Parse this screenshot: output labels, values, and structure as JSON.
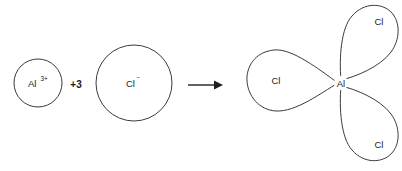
{
  "diagram": {
    "type": "chemical-reaction",
    "background_color": "#ffffff",
    "stroke_color": "#3b3b3b",
    "text_color": "#1a1a1a",
    "reactants": [
      {
        "id": "aluminium-ion",
        "shape": "circle",
        "label_base": "Al",
        "label_superscript": "3+",
        "cx": 38,
        "cy": 83,
        "r": 24
      },
      {
        "id": "chloride-ion",
        "shape": "circle",
        "label_base": "Cl",
        "label_superscript": "−",
        "cx": 134,
        "cy": 83,
        "r": 38
      }
    ],
    "coefficient": {
      "id": "chloride-coefficient",
      "text": "+3",
      "x": 76,
      "y": 85
    },
    "arrow": {
      "id": "reaction-arrow",
      "direction": "right",
      "x_start": 188,
      "x_end": 222,
      "y": 85
    },
    "product": {
      "id": "aluminium-chloride",
      "center_label": "Al",
      "center_x": 341,
      "center_y": 83,
      "lobes": [
        {
          "id": "lobe-left",
          "label": "Cl",
          "angle_deg": 180,
          "label_x": 276,
          "label_y": 81
        },
        {
          "id": "lobe-upper-right",
          "label": "Cl",
          "angle_deg": 62,
          "label_x": 379,
          "label_y": 22
        },
        {
          "id": "lobe-lower-right",
          "label": "Cl",
          "angle_deg": -62,
          "label_x": 379,
          "label_y": 145
        }
      ]
    }
  }
}
